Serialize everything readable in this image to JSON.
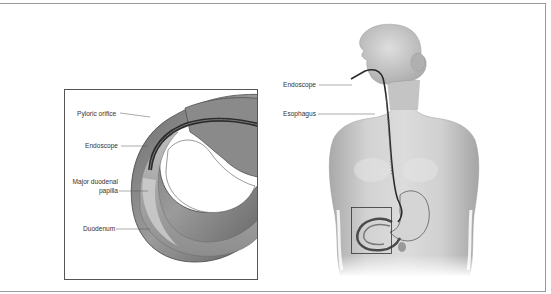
{
  "figure": {
    "inset": {
      "labels": [
        {
          "id": "pyloric-orifice",
          "text": "Pyloric orifice"
        },
        {
          "id": "endoscope",
          "text": "Endoscope"
        },
        {
          "id": "major-duodenal-papilla-line1",
          "text": "Major duodenal"
        },
        {
          "id": "major-duodenal-papilla-line2",
          "text": "papilla"
        },
        {
          "id": "duodenum",
          "text": "Duodenum"
        }
      ]
    },
    "body": {
      "labels": [
        {
          "id": "endoscope",
          "text": "Endoscope"
        },
        {
          "id": "esophagus",
          "text": "Esophagus"
        }
      ]
    },
    "colors": {
      "frame": "#9a9a9a",
      "inset_border": "#555555",
      "tissue_dark": "#5a5a5a",
      "tissue_light": "#bdbdbd",
      "skin": "#c9c9c9",
      "endoscope": "#2b2b2b"
    }
  }
}
